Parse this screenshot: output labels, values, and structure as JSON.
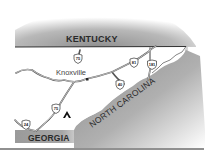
{
  "map": {
    "states": [
      {
        "name": "KENTUCKY",
        "position": "north"
      },
      {
        "name": "NORTH CAROLINA",
        "position": "southeast"
      },
      {
        "name": "GEORGIA",
        "position": "south"
      }
    ],
    "cities": [
      {
        "name": "Knoxville"
      }
    ],
    "highways": [
      {
        "number": "75",
        "location": "north of Knoxville"
      },
      {
        "number": "81",
        "location": "northeast"
      },
      {
        "number": "181",
        "location": "northeast"
      },
      {
        "number": "40",
        "location": "east of Knoxville"
      },
      {
        "number": "75",
        "location": "south of Knoxville"
      },
      {
        "number": "24",
        "location": "southwest"
      }
    ],
    "markers": [
      {
        "type": "campground",
        "symbol": "tent-icon"
      }
    ],
    "colors": {
      "neighbor_state": "#a8a8a8",
      "tennessee": "#ffffff",
      "roads": "#555555",
      "border": "#333333"
    }
  }
}
